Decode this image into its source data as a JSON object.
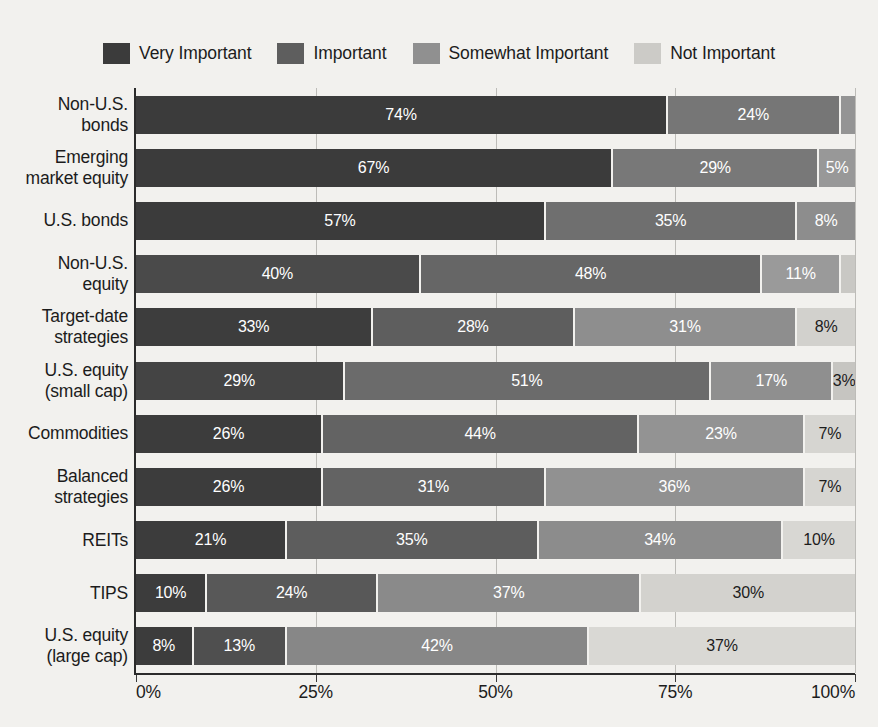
{
  "chart_data": {
    "type": "bar",
    "orientation": "horizontal",
    "stacked": true,
    "normalized": true,
    "title": "",
    "xlabel": "",
    "ylabel": "",
    "xlim": [
      0,
      100
    ],
    "xticks": [
      "0%",
      "25%",
      "50%",
      "75%",
      "100%"
    ],
    "xtick_values": [
      0,
      25,
      50,
      75,
      100
    ],
    "grid": true,
    "legend_position": "top",
    "legend": [
      "Very Important",
      "Important",
      "Somewhat Important",
      "Not Important"
    ],
    "series_colors": [
      "#3b3b3b",
      "#5e5e5e",
      "#909090",
      "#cccbc7"
    ],
    "categories": [
      "Non-U.S. bonds",
      "Emerging market equity",
      "U.S. bonds",
      "Non-U.S. equity",
      "Target-date strategies",
      "U.S. equity (small cap)",
      "Commodities",
      "Balanced strategies",
      "REITs",
      "TIPS",
      "U.S. equity (large cap)"
    ],
    "series": [
      {
        "name": "Very Important",
        "values": [
          74,
          67,
          57,
          40,
          33,
          29,
          26,
          26,
          21,
          10,
          8
        ]
      },
      {
        "name": "Important",
        "values": [
          24,
          29,
          35,
          48,
          28,
          51,
          44,
          31,
          35,
          24,
          13
        ]
      },
      {
        "name": "Somewhat Important",
        "values": [
          2,
          5,
          8,
          11,
          31,
          17,
          23,
          36,
          34,
          37,
          42
        ]
      },
      {
        "name": "Not Important",
        "values": [
          0,
          0,
          0,
          2,
          8,
          3,
          7,
          7,
          10,
          30,
          37
        ]
      }
    ]
  },
  "categories_wrapped": [
    [
      "Non-U.S.",
      "bonds"
    ],
    [
      "Emerging",
      "market equity"
    ],
    [
      "U.S. bonds"
    ],
    [
      "Non-U.S.",
      "equity"
    ],
    [
      "Target-date",
      "strategies"
    ],
    [
      "U.S. equity",
      "(small cap)"
    ],
    [
      "Commodities"
    ],
    [
      "Balanced",
      "strategies"
    ],
    [
      "REITs"
    ],
    [
      "TIPS"
    ],
    [
      "U.S. equity",
      "(large cap)"
    ]
  ],
  "rows": [
    {
      "category": "Non-U.S. bonds",
      "segments": [
        {
          "series": "Very Important",
          "value": 74,
          "label": "74%",
          "color": "#3b3b3b",
          "text": "light",
          "outside": false
        },
        {
          "series": "Important",
          "value": 24,
          "label": "24%",
          "color": "#767676",
          "text": "light",
          "outside": false
        },
        {
          "series": "Somewhat Important",
          "value": 2,
          "label": "2%",
          "color": "#949494",
          "text": "dark",
          "outside": true
        }
      ]
    },
    {
      "category": "Emerging market equity",
      "segments": [
        {
          "series": "Very Important",
          "value": 67,
          "label": "67%",
          "color": "#3b3b3b",
          "text": "light",
          "outside": false
        },
        {
          "series": "Important",
          "value": 29,
          "label": "29%",
          "color": "#787878",
          "text": "light",
          "outside": false
        },
        {
          "series": "Somewhat Important",
          "value": 5,
          "label": "5%",
          "color": "#989898",
          "text": "light",
          "outside": false
        }
      ]
    },
    {
      "category": "U.S. bonds",
      "segments": [
        {
          "series": "Very Important",
          "value": 57,
          "label": "57%",
          "color": "#3b3b3b",
          "text": "light",
          "outside": false
        },
        {
          "series": "Important",
          "value": 35,
          "label": "35%",
          "color": "#6f6f6f",
          "text": "light",
          "outside": false
        },
        {
          "series": "Somewhat Important",
          "value": 8,
          "label": "8%",
          "color": "#8d8d8d",
          "text": "light",
          "outside": false
        }
      ]
    },
    {
      "category": "Non-U.S. equity",
      "segments": [
        {
          "series": "Very Important",
          "value": 40,
          "label": "40%",
          "color": "#4a4a4a",
          "text": "light",
          "outside": false
        },
        {
          "series": "Important",
          "value": 48,
          "label": "48%",
          "color": "#666666",
          "text": "light",
          "outside": false
        },
        {
          "series": "Somewhat Important",
          "value": 11,
          "label": "11%",
          "color": "#9a9a9a",
          "text": "light",
          "outside": false
        },
        {
          "series": "Not Important",
          "value": 2,
          "label": "2%",
          "color": "#c9c8c4",
          "text": "dark",
          "outside": true
        }
      ]
    },
    {
      "category": "Target-date strategies",
      "segments": [
        {
          "series": "Very Important",
          "value": 33,
          "label": "33%",
          "color": "#3d3d3d",
          "text": "light",
          "outside": false
        },
        {
          "series": "Important",
          "value": 28,
          "label": "28%",
          "color": "#5e5e5e",
          "text": "light",
          "outside": false
        },
        {
          "series": "Somewhat Important",
          "value": 31,
          "label": "31%",
          "color": "#8e8e8e",
          "text": "light",
          "outside": false
        },
        {
          "series": "Not Important",
          "value": 8,
          "label": "8%",
          "color": "#d2d1cd",
          "text": "dark",
          "outside": false
        }
      ]
    },
    {
      "category": "U.S. equity (small cap)",
      "segments": [
        {
          "series": "Very Important",
          "value": 29,
          "label": "29%",
          "color": "#444444",
          "text": "light",
          "outside": false
        },
        {
          "series": "Important",
          "value": 51,
          "label": "51%",
          "color": "#6b6b6b",
          "text": "light",
          "outside": false
        },
        {
          "series": "Somewhat Important",
          "value": 17,
          "label": "17%",
          "color": "#8f8f8f",
          "text": "light",
          "outside": false
        },
        {
          "series": "Not Important",
          "value": 3,
          "label": "3%",
          "color": "#c6c5c1",
          "text": "dark",
          "outside": false
        }
      ]
    },
    {
      "category": "Commodities",
      "segments": [
        {
          "series": "Very Important",
          "value": 26,
          "label": "26%",
          "color": "#3c3c3c",
          "text": "light",
          "outside": false
        },
        {
          "series": "Important",
          "value": 44,
          "label": "44%",
          "color": "#636363",
          "text": "light",
          "outside": false
        },
        {
          "series": "Somewhat Important",
          "value": 23,
          "label": "23%",
          "color": "#939393",
          "text": "light",
          "outside": false
        },
        {
          "series": "Not Important",
          "value": 7,
          "label": "7%",
          "color": "#d6d5d1",
          "text": "dark",
          "outside": false
        }
      ]
    },
    {
      "category": "Balanced strategies",
      "segments": [
        {
          "series": "Very Important",
          "value": 26,
          "label": "26%",
          "color": "#3c3c3c",
          "text": "light",
          "outside": false
        },
        {
          "series": "Important",
          "value": 31,
          "label": "31%",
          "color": "#636363",
          "text": "light",
          "outside": false
        },
        {
          "series": "Somewhat Important",
          "value": 36,
          "label": "36%",
          "color": "#919191",
          "text": "light",
          "outside": false
        },
        {
          "series": "Not Important",
          "value": 7,
          "label": "7%",
          "color": "#d6d5d1",
          "text": "dark",
          "outside": false
        }
      ]
    },
    {
      "category": "REITs",
      "segments": [
        {
          "series": "Very Important",
          "value": 21,
          "label": "21%",
          "color": "#3c3c3c",
          "text": "light",
          "outside": false
        },
        {
          "series": "Important",
          "value": 35,
          "label": "35%",
          "color": "#5d5d5d",
          "text": "light",
          "outside": false
        },
        {
          "series": "Somewhat Important",
          "value": 34,
          "label": "34%",
          "color": "#8c8c8c",
          "text": "light",
          "outside": false
        },
        {
          "series": "Not Important",
          "value": 10,
          "label": "10%",
          "color": "#d8d7d3",
          "text": "dark",
          "outside": false
        }
      ]
    },
    {
      "category": "TIPS",
      "segments": [
        {
          "series": "Very Important",
          "value": 10,
          "label": "10%",
          "color": "#3c3c3c",
          "text": "light",
          "outside": false
        },
        {
          "series": "Important",
          "value": 24,
          "label": "24%",
          "color": "#585858",
          "text": "light",
          "outside": false
        },
        {
          "series": "Somewhat Important",
          "value": 37,
          "label": "37%",
          "color": "#8a8a8a",
          "text": "light",
          "outside": false
        },
        {
          "series": "Not Important",
          "value": 30,
          "label": "30%",
          "color": "#d3d2ce",
          "text": "dark",
          "outside": false
        }
      ]
    },
    {
      "category": "U.S. equity (large cap)",
      "segments": [
        {
          "series": "Very Important",
          "value": 8,
          "label": "8%",
          "color": "#3c3c3c",
          "text": "light",
          "outside": false
        },
        {
          "series": "Important",
          "value": 13,
          "label": "13%",
          "color": "#4f4f4f",
          "text": "light",
          "outside": false
        },
        {
          "series": "Somewhat Important",
          "value": 42,
          "label": "42%",
          "color": "#878787",
          "text": "light",
          "outside": false
        },
        {
          "series": "Not Important",
          "value": 37,
          "label": "37%",
          "color": "#d9d8d4",
          "text": "dark",
          "outside": false
        }
      ]
    }
  ],
  "legend": {
    "items": [
      {
        "label": "Very Important",
        "color": "#3b3b3b"
      },
      {
        "label": "Important",
        "color": "#5e5e5e"
      },
      {
        "label": "Somewhat Important",
        "color": "#909090"
      },
      {
        "label": "Not Important",
        "color": "#cccbc7"
      }
    ]
  },
  "xaxis": {
    "ticks": [
      {
        "label": "0%",
        "value": 0
      },
      {
        "label": "25%",
        "value": 25
      },
      {
        "label": "50%",
        "value": 50
      },
      {
        "label": "75%",
        "value": 75
      },
      {
        "label": "100%",
        "value": 100
      }
    ]
  }
}
